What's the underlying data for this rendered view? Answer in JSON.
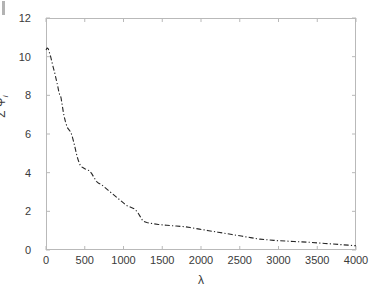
{
  "chart_data": {
    "type": "line",
    "title": "",
    "xlabel": "λ",
    "ylabel_sigma": "Σ Ψ",
    "ylabel_sub": "i",
    "xlim": [
      0,
      4000
    ],
    "ylim": [
      0,
      12
    ],
    "xticks": [
      0,
      500,
      1000,
      1500,
      2000,
      2500,
      3000,
      3500,
      4000
    ],
    "yticks": [
      0,
      2,
      4,
      6,
      8,
      10,
      12
    ],
    "xtick_labels": [
      "0",
      "500",
      "1000",
      "1500",
      "2000",
      "2500",
      "3000",
      "3500",
      "4000"
    ],
    "ytick_labels": [
      "0",
      "2",
      "4",
      "6",
      "8",
      "10",
      "12"
    ],
    "grid": false,
    "legend": null,
    "line_style": "dash-dot",
    "line_color": "#262626",
    "line_width": 1.1,
    "axis_color": "#b9b9b9",
    "tick_color": "#3a3a3a",
    "background": "#ffffff",
    "series": [
      {
        "name": "cumulative-psi",
        "x": [
          0,
          15,
          30,
          45,
          60,
          75,
          90,
          110,
          130,
          150,
          165,
          175,
          185,
          195,
          205,
          215,
          225,
          235,
          250,
          265,
          280,
          300,
          320,
          340,
          360,
          380,
          400,
          420,
          440,
          460,
          480,
          500,
          530,
          560,
          590,
          620,
          650,
          680,
          710,
          740,
          770,
          800,
          830,
          860,
          890,
          920,
          950,
          980,
          1010,
          1040,
          1070,
          1100,
          1130,
          1160,
          1190,
          1220,
          1250,
          1300,
          1350,
          1400,
          1450,
          1500,
          1560,
          1620,
          1680,
          1740,
          1800,
          1860,
          1920,
          1980,
          2040,
          2100,
          2160,
          2220,
          2280,
          2340,
          2400,
          2460,
          2520,
          2580,
          2640,
          2700,
          2760,
          2820,
          2880,
          2940,
          3000,
          3100,
          3200,
          3300,
          3400,
          3500,
          3600,
          3700,
          3800,
          3900,
          4000
        ],
        "y": [
          10.35,
          10.45,
          10.4,
          10.2,
          10.0,
          9.75,
          9.5,
          9.2,
          8.85,
          8.5,
          8.2,
          8.05,
          8.0,
          7.85,
          7.6,
          7.35,
          7.1,
          6.9,
          6.65,
          6.45,
          6.3,
          6.2,
          6.1,
          5.85,
          5.55,
          5.2,
          4.85,
          4.6,
          4.4,
          4.3,
          4.25,
          4.2,
          4.15,
          4.1,
          3.95,
          3.75,
          3.55,
          3.45,
          3.4,
          3.3,
          3.2,
          3.1,
          3.0,
          2.9,
          2.8,
          2.7,
          2.6,
          2.5,
          2.4,
          2.3,
          2.25,
          2.2,
          2.15,
          2.05,
          1.9,
          1.7,
          1.5,
          1.42,
          1.38,
          1.35,
          1.32,
          1.3,
          1.28,
          1.26,
          1.24,
          1.22,
          1.2,
          1.16,
          1.12,
          1.08,
          1.04,
          1.0,
          0.96,
          0.92,
          0.88,
          0.84,
          0.8,
          0.76,
          0.72,
          0.68,
          0.64,
          0.6,
          0.56,
          0.54,
          0.52,
          0.5,
          0.48,
          0.46,
          0.44,
          0.42,
          0.4,
          0.37,
          0.34,
          0.31,
          0.28,
          0.25,
          0.22
        ]
      }
    ]
  }
}
